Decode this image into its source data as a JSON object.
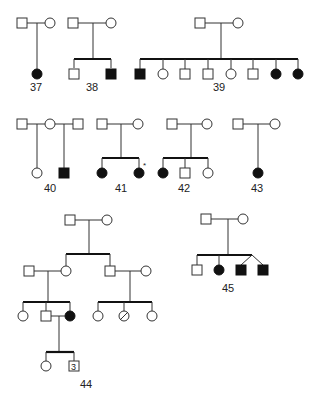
{
  "diagram": {
    "type": "pedigree-chart",
    "legend_conventions": {
      "square": "male",
      "circle": "female",
      "filled": "affected",
      "unfilled": "unaffected",
      "slashed": "deceased",
      "number_in_symbol": "multiple individuals"
    },
    "colors": {
      "line": "#333333",
      "affected": "#111111",
      "background": "#ffffff"
    },
    "pedigrees": [
      {
        "id": "37",
        "label": "37"
      },
      {
        "id": "38",
        "label": "38"
      },
      {
        "id": "39",
        "label": "39"
      },
      {
        "id": "40",
        "label": "40"
      },
      {
        "id": "41",
        "label": "41",
        "annotation": "*"
      },
      {
        "id": "42",
        "label": "42"
      },
      {
        "id": "43",
        "label": "43"
      },
      {
        "id": "44",
        "label": "44",
        "count_in_symbol": "3"
      },
      {
        "id": "45",
        "label": "45"
      }
    ]
  }
}
